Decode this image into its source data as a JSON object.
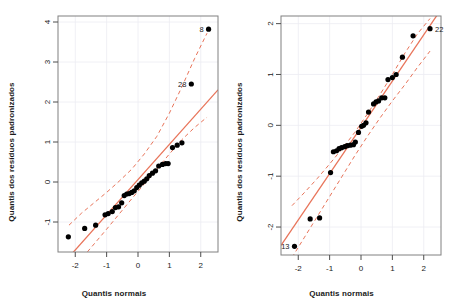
{
  "figure": {
    "background": "#ffffff",
    "panel_count": 2
  },
  "style": {
    "line_color": "#e8745a",
    "point_color": "#000000",
    "grid_color": "#ececf2",
    "box_color": "#808080",
    "axis_text_color": "#1a1a1a"
  },
  "chart_data": [
    {
      "id": "left-qq-plot",
      "type": "scatter",
      "title": "",
      "xlabel": "Quantis normais",
      "ylabel": "Quantis dos resíduos padronizados",
      "xlim": [
        -2.55,
        2.55
      ],
      "ylim": [
        -1.75,
        4.15
      ],
      "xticks": [
        -2,
        -1,
        0,
        1,
        2
      ],
      "yticks": [
        -1,
        0,
        1,
        2,
        3,
        4
      ],
      "xticklabels": [
        "-2",
        "-1",
        "0",
        "1",
        "2"
      ],
      "yticklabels": [
        "-1",
        "0",
        "1",
        "2",
        "3",
        "4"
      ],
      "grid": true,
      "legend": "none",
      "reference_line": {
        "intercept": 0.06,
        "slope": 0.88,
        "style": "solid"
      },
      "envelope_upper": [
        {
          "x": -2.2,
          "y": -1.08
        },
        {
          "x": -1.8,
          "y": -0.78
        },
        {
          "x": -1.4,
          "y": -0.52
        },
        {
          "x": -1.0,
          "y": -0.26
        },
        {
          "x": -0.6,
          "y": 0.02
        },
        {
          "x": -0.2,
          "y": 0.32
        },
        {
          "x": 0.2,
          "y": 0.7
        },
        {
          "x": 0.6,
          "y": 1.14
        },
        {
          "x": 1.0,
          "y": 1.72
        },
        {
          "x": 1.4,
          "y": 2.38
        },
        {
          "x": 1.8,
          "y": 3.08
        },
        {
          "x": 2.2,
          "y": 3.72
        }
      ],
      "envelope_lower": [
        {
          "x": -2.2,
          "y": -2.3
        },
        {
          "x": -1.8,
          "y": -1.92
        },
        {
          "x": -1.4,
          "y": -1.55
        },
        {
          "x": -1.0,
          "y": -1.18
        },
        {
          "x": -0.6,
          "y": -0.8
        },
        {
          "x": -0.2,
          "y": -0.42
        },
        {
          "x": 0.2,
          "y": -0.05
        },
        {
          "x": 0.6,
          "y": 0.32
        },
        {
          "x": 1.0,
          "y": 0.7
        },
        {
          "x": 1.4,
          "y": 1.06
        },
        {
          "x": 1.8,
          "y": 1.36
        },
        {
          "x": 2.2,
          "y": 1.62
        }
      ],
      "points": [
        {
          "x": -2.22,
          "y": -1.37
        },
        {
          "x": -1.7,
          "y": -1.16
        },
        {
          "x": -1.35,
          "y": -1.08
        },
        {
          "x": -1.05,
          "y": -0.82
        },
        {
          "x": -0.95,
          "y": -0.79
        },
        {
          "x": -0.82,
          "y": -0.74
        },
        {
          "x": -0.72,
          "y": -0.64
        },
        {
          "x": -0.62,
          "y": -0.62
        },
        {
          "x": -0.52,
          "y": -0.52
        },
        {
          "x": -0.44,
          "y": -0.34
        },
        {
          "x": -0.36,
          "y": -0.3
        },
        {
          "x": -0.28,
          "y": -0.29
        },
        {
          "x": -0.2,
          "y": -0.26
        },
        {
          "x": -0.12,
          "y": -0.22
        },
        {
          "x": -0.04,
          "y": -0.14
        },
        {
          "x": 0.04,
          "y": -0.08
        },
        {
          "x": 0.12,
          "y": -0.02
        },
        {
          "x": 0.2,
          "y": 0.02
        },
        {
          "x": 0.28,
          "y": 0.08
        },
        {
          "x": 0.36,
          "y": 0.16
        },
        {
          "x": 0.46,
          "y": 0.22
        },
        {
          "x": 0.56,
          "y": 0.28
        },
        {
          "x": 0.66,
          "y": 0.4
        },
        {
          "x": 0.78,
          "y": 0.44
        },
        {
          "x": 0.88,
          "y": 0.46
        },
        {
          "x": 0.96,
          "y": 0.46
        },
        {
          "x": 1.1,
          "y": 0.86
        },
        {
          "x": 1.25,
          "y": 0.92
        },
        {
          "x": 1.4,
          "y": 0.98
        },
        {
          "x": 1.7,
          "y": 2.45
        },
        {
          "x": 2.25,
          "y": 3.82
        }
      ],
      "annotations": [
        {
          "label": "8",
          "x": 2.25,
          "y": 3.82,
          "anchor": "left"
        },
        {
          "label": "28",
          "x": 1.7,
          "y": 2.45,
          "anchor": "left"
        }
      ]
    },
    {
      "id": "right-qq-plot",
      "type": "scatter",
      "title": "",
      "xlabel": "Quantis normais",
      "ylabel": "Quantis dos resíduos padronizados",
      "xlim": [
        -2.55,
        2.55
      ],
      "ylim": [
        -2.55,
        2.15
      ],
      "xticks": [
        -2,
        -1,
        0,
        1,
        2
      ],
      "yticks": [
        -2,
        -1,
        0,
        1,
        2
      ],
      "xticklabels": [
        "-2",
        "-1",
        "0",
        "1",
        "2"
      ],
      "yticklabels": [
        "-2",
        "-1",
        "0",
        "1",
        "2"
      ],
      "grid": true,
      "legend": "none",
      "reference_line": {
        "intercept": -0.04,
        "slope": 0.91,
        "style": "solid"
      },
      "envelope_upper": [
        {
          "x": -2.2,
          "y": -1.58
        },
        {
          "x": -1.8,
          "y": -1.32
        },
        {
          "x": -1.4,
          "y": -1.05
        },
        {
          "x": -1.0,
          "y": -0.76
        },
        {
          "x": -0.6,
          "y": -0.46
        },
        {
          "x": -0.2,
          "y": -0.14
        },
        {
          "x": 0.2,
          "y": 0.22
        },
        {
          "x": 0.6,
          "y": 0.6
        },
        {
          "x": 1.0,
          "y": 1.0
        },
        {
          "x": 1.4,
          "y": 1.42
        },
        {
          "x": 1.8,
          "y": 1.8
        },
        {
          "x": 2.2,
          "y": 2.1
        }
      ],
      "envelope_lower": [
        {
          "x": -2.2,
          "y": -2.6
        },
        {
          "x": -1.8,
          "y": -2.2
        },
        {
          "x": -1.4,
          "y": -1.8
        },
        {
          "x": -1.0,
          "y": -1.4
        },
        {
          "x": -0.6,
          "y": -1.0
        },
        {
          "x": -0.2,
          "y": -0.6
        },
        {
          "x": 0.2,
          "y": -0.22
        },
        {
          "x": 0.6,
          "y": 0.14
        },
        {
          "x": 1.0,
          "y": 0.48
        },
        {
          "x": 1.4,
          "y": 0.8
        },
        {
          "x": 1.8,
          "y": 1.14
        },
        {
          "x": 2.2,
          "y": 1.46
        }
      ],
      "points": [
        {
          "x": -2.12,
          "y": -2.38
        },
        {
          "x": -1.62,
          "y": -1.84
        },
        {
          "x": -1.32,
          "y": -1.82
        },
        {
          "x": -0.97,
          "y": -0.93
        },
        {
          "x": -0.88,
          "y": -0.52
        },
        {
          "x": -0.78,
          "y": -0.5
        },
        {
          "x": -0.7,
          "y": -0.46
        },
        {
          "x": -0.62,
          "y": -0.44
        },
        {
          "x": -0.52,
          "y": -0.42
        },
        {
          "x": -0.44,
          "y": -0.4
        },
        {
          "x": -0.34,
          "y": -0.39
        },
        {
          "x": -0.24,
          "y": -0.38
        },
        {
          "x": -0.18,
          "y": -0.33
        },
        {
          "x": -0.08,
          "y": -0.14
        },
        {
          "x": 0.02,
          "y": -0.02
        },
        {
          "x": 0.08,
          "y": 0.0
        },
        {
          "x": 0.16,
          "y": 0.05
        },
        {
          "x": 0.24,
          "y": 0.26
        },
        {
          "x": 0.4,
          "y": 0.42
        },
        {
          "x": 0.48,
          "y": 0.46
        },
        {
          "x": 0.56,
          "y": 0.48
        },
        {
          "x": 0.66,
          "y": 0.54
        },
        {
          "x": 0.76,
          "y": 0.54
        },
        {
          "x": 0.86,
          "y": 0.9
        },
        {
          "x": 1.0,
          "y": 0.94
        },
        {
          "x": 1.12,
          "y": 1.0
        },
        {
          "x": 1.32,
          "y": 1.34
        },
        {
          "x": 1.66,
          "y": 1.76
        },
        {
          "x": 2.2,
          "y": 1.9
        }
      ],
      "annotations": [
        {
          "label": "22",
          "x": 2.2,
          "y": 1.9,
          "anchor": "right"
        },
        {
          "label": "13",
          "x": -2.12,
          "y": -2.38,
          "anchor": "left"
        }
      ]
    }
  ]
}
